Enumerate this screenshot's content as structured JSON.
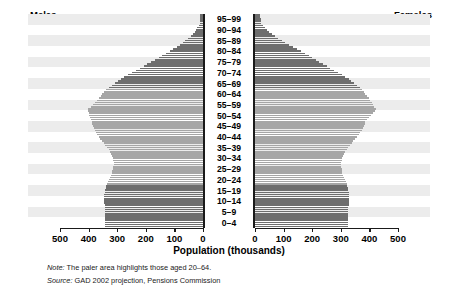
{
  "header": {
    "males_label": "Males",
    "females_label": "Females"
  },
  "axis": {
    "x_title": "Population (thousands)",
    "left_ticks": [
      "500",
      "400",
      "300",
      "200",
      "100",
      "0"
    ],
    "right_ticks": [
      "0",
      "100",
      "200",
      "300",
      "400",
      "500"
    ]
  },
  "footnotes": {
    "note_prefix": "Note:",
    "note_text": " The paler area highlights those aged 20–64.",
    "source_prefix": "Source:",
    "source_text": " GAD 2002 projection, Pensions Commission"
  },
  "colors": {
    "dark_bar": "#6e6e6e",
    "light_bar": "#a6a6a6",
    "band_stripe": "#ececec",
    "axis": "#1a1a1a",
    "background": "#ffffff"
  },
  "chart_data": {
    "type": "bar",
    "title": "",
    "subtitle": "",
    "xlabel": "Population (thousands)",
    "ylabel": "",
    "orientation": "horizontal-diverging",
    "xlim": [
      -500,
      500
    ],
    "xlim_abs": [
      0,
      500
    ],
    "grid": false,
    "legend": [
      "Males",
      "Females"
    ],
    "legend_position": "top-outside",
    "units": "thousands",
    "highlight_band": {
      "from": "20–24",
      "to": "60–64",
      "label": "paler area = aged 20–64"
    },
    "categories": [
      "0–4",
      "5–9",
      "10–14",
      "15–19",
      "20–24",
      "25–29",
      "30–34",
      "35–39",
      "40–44",
      "45–49",
      "50–54",
      "55–59",
      "60–64",
      "65–69",
      "70–74",
      "75–79",
      "80–84",
      "85–89",
      "90–94",
      "95–99"
    ],
    "series": [
      {
        "name": "Males",
        "side": "left",
        "values": [
          343,
          343,
          344,
          347,
          338,
          320,
          310,
          322,
          350,
          378,
          390,
          404,
          368,
          335,
          282,
          214,
          148,
          86,
          37,
          12
        ],
        "shade": [
          "dark",
          "dark",
          "dark",
          "dark",
          "light",
          "light",
          "light",
          "light",
          "light",
          "light",
          "light",
          "light",
          "light",
          "dark",
          "dark",
          "dark",
          "dark",
          "dark",
          "dark",
          "dark"
        ]
      },
      {
        "name": "Females",
        "side": "right",
        "values": [
          326,
          326,
          327,
          330,
          322,
          306,
          299,
          312,
          341,
          371,
          388,
          425,
          400,
          372,
          322,
          257,
          194,
          125,
          62,
          23
        ],
        "shade": [
          "dark",
          "dark",
          "dark",
          "dark",
          "light",
          "light",
          "light",
          "light",
          "light",
          "light",
          "light",
          "light",
          "light",
          "dark",
          "dark",
          "dark",
          "dark",
          "dark",
          "dark",
          "dark"
        ]
      }
    ]
  }
}
